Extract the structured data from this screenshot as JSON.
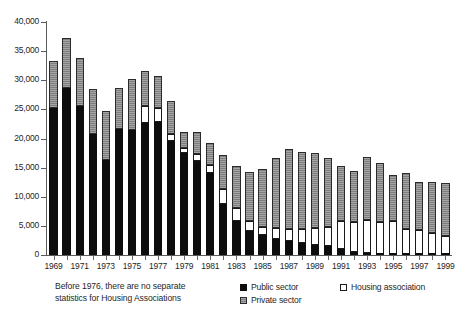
{
  "chart_data": {
    "type": "bar",
    "stacked": true,
    "title": "",
    "xlabel": "",
    "ylabel": "",
    "ylim": [
      0,
      40000
    ],
    "ytick_step": 5000,
    "ytick_labels": [
      "0",
      "5,000",
      "10,000",
      "15,000",
      "20,000",
      "25,000",
      "30,000",
      "35,000",
      "40,000"
    ],
    "ytick_values": [
      0,
      5000,
      10000,
      15000,
      20000,
      25000,
      30000,
      35000,
      40000
    ],
    "grid": false,
    "legend_position": "bottom-right",
    "categories": [
      "1969",
      "1970",
      "1971",
      "1972",
      "1973",
      "1974",
      "1975",
      "1976",
      "1977",
      "1978",
      "1979",
      "1980",
      "1981",
      "1982",
      "1983",
      "1984",
      "1985",
      "1986",
      "1987",
      "1988",
      "1989",
      "1990",
      "1991",
      "1992",
      "1993",
      "1994",
      "1995",
      "1996",
      "1997",
      "1998",
      "1999"
    ],
    "xtick_labels_shown": [
      "1969",
      "1971",
      "1973",
      "1975",
      "1977",
      "1979",
      "1981",
      "1983",
      "1985",
      "1987",
      "1989",
      "1991",
      "1993",
      "1995",
      "1997",
      "1999"
    ],
    "series": [
      {
        "name": "Public sector",
        "color": "#0d0d0d",
        "values": [
          25200,
          28700,
          25500,
          20800,
          16300,
          21600,
          21500,
          22600,
          22900,
          19600,
          17500,
          16200,
          14000,
          8700,
          5900,
          4200,
          3400,
          2800,
          2400,
          2000,
          1700,
          1500,
          1000,
          500,
          400,
          200,
          200,
          150,
          100,
          100,
          100
        ]
      },
      {
        "name": "Housing association",
        "color": "#ffffff",
        "values": [
          0,
          0,
          0,
          0,
          0,
          0,
          0,
          3000,
          2300,
          1100,
          900,
          1200,
          1400,
          2600,
          2200,
          1600,
          1400,
          1800,
          2100,
          2400,
          2900,
          3300,
          4800,
          5200,
          5600,
          5500,
          5700,
          4400,
          4200,
          3700,
          3200
        ]
      },
      {
        "name": "Private sector",
        "color": "#8c8c8c",
        "values": [
          8100,
          8600,
          8300,
          7700,
          8400,
          7100,
          8700,
          6000,
          5600,
          5800,
          2800,
          3700,
          3800,
          5800,
          7200,
          8500,
          10000,
          12100,
          13700,
          13300,
          13000,
          11900,
          9500,
          8800,
          10800,
          10100,
          7900,
          9600,
          8200,
          8700,
          9100
        ]
      }
    ],
    "totals": [
      33300,
      37300,
      33800,
      28500,
      24700,
      28700,
      30200,
      31600,
      30800,
      26500,
      21200,
      21100,
      19200,
      17100,
      15300,
      14300,
      14800,
      16700,
      18200,
      17700,
      17600,
      16700,
      15300,
      14500,
      16800,
      15800,
      13800,
      14150,
      12500,
      12500,
      12400
    ]
  },
  "caption": {
    "line1": "Before 1976, there are no separate",
    "line2": "statistics for Housing Associations"
  },
  "legend": {
    "items": [
      {
        "label": "Public sector",
        "swatch": "black-square-icon"
      },
      {
        "label": "Housing association",
        "swatch": "white-square-icon"
      },
      {
        "label": "Private sector",
        "swatch": "grey-square-icon"
      }
    ]
  }
}
